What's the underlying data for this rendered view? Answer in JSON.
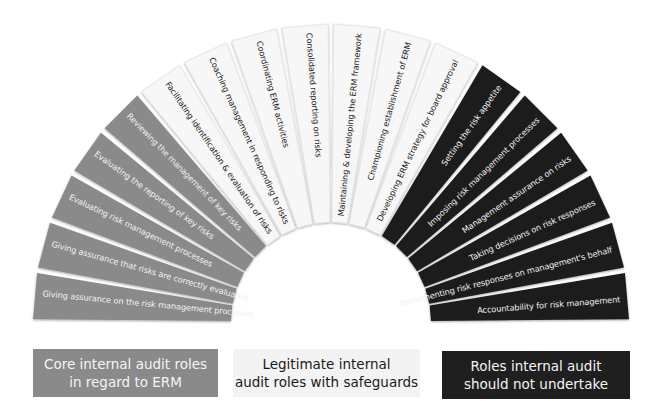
{
  "diagram": {
    "type": "fan",
    "center": {
      "x": 331,
      "y": 322
    },
    "outer_radius": 298,
    "inner_radius": 100,
    "colors": {
      "core": "#8a8a8a",
      "legitimate": "#f7f7f7",
      "not_undertake": "#1f1f1f",
      "core_text": "#f2f2f2",
      "legitimate_text": "#1a1a1a",
      "not_undertake_text": "#f2f2f2"
    },
    "blades": [
      {
        "label": "Giving assurance on the risk management processes",
        "category": "core"
      },
      {
        "label": "Giving assurance that risks are correctly evaluated",
        "category": "core"
      },
      {
        "label": "Evaluating risk management processes",
        "category": "core"
      },
      {
        "label": "Evaluating the reporting of key risks",
        "category": "core"
      },
      {
        "label": "Reviewing the management of key risks",
        "category": "core"
      },
      {
        "label": "Facilitating identification & evaluation of risks",
        "category": "legitimate"
      },
      {
        "label": "Coaching management in responding to risks",
        "category": "legitimate"
      },
      {
        "label": "Coordinating ERM activities",
        "category": "legitimate"
      },
      {
        "label": "Consolidated reporting on risks",
        "category": "legitimate"
      },
      {
        "label": "Maintaining & developing the ERM framework",
        "category": "legitimate"
      },
      {
        "label": "Championing establishment of ERM",
        "category": "legitimate"
      },
      {
        "label": "Developing ERM strategy for board approval",
        "category": "legitimate"
      },
      {
        "label": "Setting the risk appetite",
        "category": "not_undertake"
      },
      {
        "label": "Imposing risk management processes",
        "category": "not_undertake"
      },
      {
        "label": "Management assurance on risks",
        "category": "not_undertake"
      },
      {
        "label": "Taking decisions on risk responses",
        "category": "not_undertake"
      },
      {
        "label": "Implementing risk responses on management's behalf",
        "category": "not_undertake"
      },
      {
        "label": "Accountability for risk management",
        "category": "not_undertake"
      }
    ]
  },
  "legend": {
    "core": {
      "line1": "Core internal audit roles",
      "line2": "in regard to ERM"
    },
    "legitimate": {
      "line1": "Legitimate internal",
      "line2": "audit roles with safeguards"
    },
    "not_undertake": {
      "line1": "Roles internal audit",
      "line2": "should not undertake"
    }
  }
}
